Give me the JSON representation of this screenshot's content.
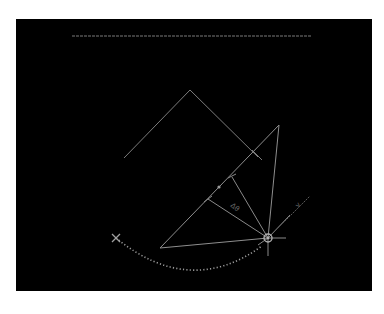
{
  "canvas": {
    "background": "#000000",
    "page_background": "#ffffff",
    "line_color": "#8a8a8a",
    "bright_line_color": "#b0b0b0",
    "dot_color": "#9a9a9a"
  },
  "labels": {
    "angle_label": "Δθ",
    "direction_label": "v"
  },
  "markers": {
    "start_marker": "×",
    "hub_marker": "⊗"
  }
}
